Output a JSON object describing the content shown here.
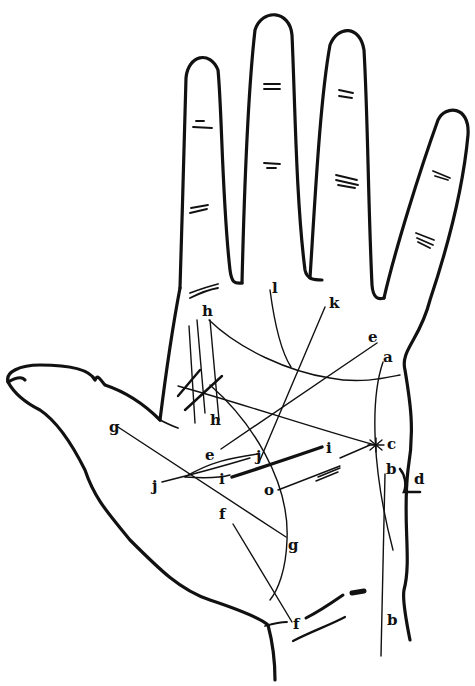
{
  "figure": {
    "labels": [
      {
        "id": "l",
        "text": "l",
        "x": 272,
        "y": 293
      },
      {
        "id": "k",
        "text": "k",
        "x": 329,
        "y": 308
      },
      {
        "id": "h-top",
        "text": "h",
        "x": 202,
        "y": 316
      },
      {
        "id": "e-top",
        "text": "e",
        "x": 368,
        "y": 342
      },
      {
        "id": "a",
        "text": "a",
        "x": 383,
        "y": 362
      },
      {
        "id": "h-bottom",
        "text": "h",
        "x": 210,
        "y": 425
      },
      {
        "id": "g-left",
        "text": "g",
        "x": 109,
        "y": 432
      },
      {
        "id": "c",
        "text": "c",
        "x": 397,
        "y": 449
      },
      {
        "id": "i-right",
        "text": "i",
        "x": 326,
        "y": 453
      },
      {
        "id": "e-mid",
        "text": "e",
        "x": 205,
        "y": 460
      },
      {
        "id": "j-mid",
        "text": "j",
        "x": 256,
        "y": 461
      },
      {
        "id": "b-top",
        "text": "b",
        "x": 386,
        "y": 474
      },
      {
        "id": "d",
        "text": "d",
        "x": 414,
        "y": 484
      },
      {
        "id": "i-left",
        "text": "i",
        "x": 219,
        "y": 480
      },
      {
        "id": "j-left",
        "text": "j",
        "x": 152,
        "y": 491
      },
      {
        "id": "o",
        "text": "o",
        "x": 264,
        "y": 495
      },
      {
        "id": "f-mid",
        "text": "f",
        "x": 219,
        "y": 519
      },
      {
        "id": "g-right",
        "text": "g",
        "x": 288,
        "y": 550
      },
      {
        "id": "f-bottom",
        "text": "f",
        "x": 293,
        "y": 629
      },
      {
        "id": "b-bottom",
        "text": "b",
        "x": 387,
        "y": 625
      }
    ]
  },
  "colors": {
    "ink": "#111111",
    "paper": "#ffffff"
  }
}
